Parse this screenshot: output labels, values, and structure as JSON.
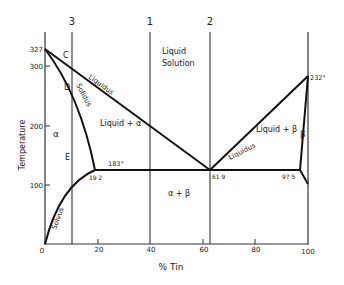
{
  "diagram": {
    "x_axis": {
      "label": "% Tin",
      "ticks": [
        "0",
        "20",
        "40",
        "60",
        "80",
        "100"
      ]
    },
    "y_axis": {
      "label": "Temperature",
      "ticks": [
        "100",
        "200",
        "300",
        "327"
      ]
    },
    "vertical_line_labels": [
      "3",
      "1",
      "2"
    ],
    "regions": {
      "liquid_solution_line1": "Liquid",
      "liquid_solution_line2": "Solution",
      "liquid_alpha": "Liquid + α",
      "liquid_beta": "Liquid + β",
      "alpha": "α",
      "beta": "β",
      "alpha_beta": "α + β"
    },
    "curve_labels": {
      "liquidus_left": "Liquidus",
      "solidus": "Solidus",
      "liquidus_right": "Liquidus",
      "solvus": "Solvus"
    },
    "point_labels": {
      "C": "C",
      "D": "D",
      "E": "E"
    },
    "annotations": {
      "eutectic_temp": "183°",
      "alpha_limit": "19·2",
      "eutectic_comp": "61·9",
      "beta_limit": "97·5",
      "tin_melt": "232°"
    }
  }
}
